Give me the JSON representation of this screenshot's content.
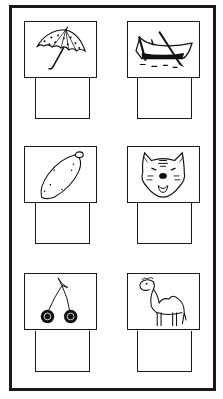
{
  "worksheet": {
    "type": "picture-naming",
    "layout": {
      "rows": 3,
      "cols": 2
    },
    "border_color": "#1a1a1a",
    "items": [
      {
        "picture": "umbrella",
        "icon": "umbrella-icon",
        "answer": ""
      },
      {
        "picture": "rowboat",
        "icon": "boat-icon",
        "answer": ""
      },
      {
        "picture": "sweet potato",
        "icon": "sweet-potato-icon",
        "answer": ""
      },
      {
        "picture": "tiger",
        "icon": "tiger-icon",
        "answer": ""
      },
      {
        "picture": "cherries",
        "icon": "cherries-icon",
        "answer": ""
      },
      {
        "picture": "camel",
        "icon": "camel-icon",
        "answer": ""
      }
    ]
  }
}
